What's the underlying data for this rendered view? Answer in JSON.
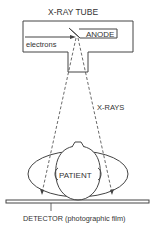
{
  "diagram": {
    "tube_label": "X-RAY TUBE",
    "anode_label": "ANODE",
    "electrons_label": "electrons",
    "xrays_label": "X-RAYS",
    "patient_label": "PATIENT",
    "detector_label": "DETECTOR (photographic film)"
  }
}
